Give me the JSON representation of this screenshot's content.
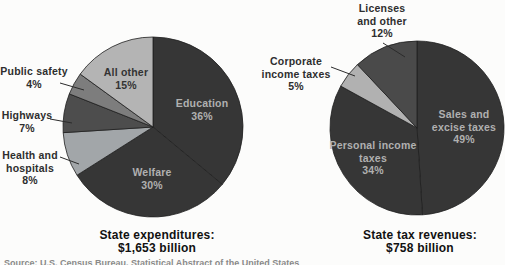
{
  "figure": {
    "background": "#fcfcfb",
    "dark_slice_color": "#363636",
    "inside_label_light_color": "#b0b0b0",
    "outside_label_color": "#2e2e2e",
    "source_note": "Source: U.S. Census Bureau, Statistical Abstract of the United States"
  },
  "chart_data": [
    {
      "type": "pie",
      "title": "State expenditures: $1,653 billion",
      "caption_line1": "State expenditures:",
      "caption_line2": "$1,653 billion",
      "total": "$1,653 billion",
      "start_angle_deg": 0,
      "direction": "clockwise",
      "legend_position": "labels-on-chart",
      "pie": {
        "cx": 153,
        "cy": 127,
        "r": 90
      },
      "slices": [
        {
          "name": "Education",
          "pct": 36,
          "pct_label": "36%",
          "color": "#363636",
          "label_lines": [
            "Education"
          ],
          "label_placement": "inside",
          "label_color": "#b0b0b0",
          "label_cx": 202,
          "label_cy": 109
        },
        {
          "name": "Welfare",
          "pct": 30,
          "pct_label": "30%",
          "color": "#363636",
          "label_lines": [
            "Welfare"
          ],
          "label_placement": "inside",
          "label_color": "#b0b0b0",
          "label_cx": 152,
          "label_cy": 178
        },
        {
          "name": "Health and hospitals",
          "pct": 8,
          "pct_label": "8%",
          "color": "#a2a6a9",
          "label_lines": [
            "Health and",
            "hospitals"
          ],
          "label_placement": "outside",
          "label_color": "#2e2e2e",
          "label_cx": 30,
          "label_cy": 168,
          "leader": [
            60,
            157,
            79,
            164
          ]
        },
        {
          "name": "Highways",
          "pct": 7,
          "pct_label": "7%",
          "color": "#4d4d4d",
          "label_lines": [
            "Highways"
          ],
          "label_placement": "outside",
          "label_color": "#2e2e2e",
          "label_cx": 27,
          "label_cy": 121,
          "leader": [
            50,
            119,
            72,
            123
          ]
        },
        {
          "name": "Public safety",
          "pct": 4,
          "pct_label": "4%",
          "color": "#7d7d7d",
          "label_lines": [
            "Public safety"
          ],
          "label_placement": "outside",
          "label_color": "#2e2e2e",
          "label_cx": 34,
          "label_cy": 77,
          "leader": [
            60,
            83,
            84,
            90
          ]
        },
        {
          "name": "All other",
          "pct": 15,
          "pct_label": "15%",
          "color": "#b4b4b4",
          "label_lines": [
            "All other"
          ],
          "label_placement": "inside",
          "label_color": "#333333",
          "label_cx": 126,
          "label_cy": 78
        }
      ]
    },
    {
      "type": "pie",
      "title": "State tax revenues: $758 billion",
      "caption_line1": "State tax revenues:",
      "caption_line2": "$758 billion",
      "total": "$758 billion",
      "start_angle_deg": 0,
      "direction": "clockwise",
      "legend_position": "labels-on-chart",
      "pie": {
        "cx": 164,
        "cy": 128,
        "r": 87
      },
      "slices": [
        {
          "name": "Sales and excise taxes",
          "pct": 49,
          "pct_label": "49%",
          "color": "#363636",
          "label_lines": [
            "Sales and",
            "excise taxes"
          ],
          "label_placement": "inside",
          "label_color": "#b0b0b0",
          "label_cx": 211,
          "label_cy": 127
        },
        {
          "name": "Personal income taxes",
          "pct": 34,
          "pct_label": "34%",
          "color": "#363636",
          "label_lines": [
            "Personal income",
            "taxes"
          ],
          "label_placement": "inside",
          "label_color": "#b0b0b0",
          "label_cx": 120,
          "label_cy": 158
        },
        {
          "name": "Corporate income taxes",
          "pct": 5,
          "pct_label": "5%",
          "color": "#b1b1b1",
          "label_lines": [
            "Corporate",
            "income taxes"
          ],
          "label_placement": "outside",
          "label_color": "#2e2e2e",
          "label_cx": 43,
          "label_cy": 74,
          "leader": [
            78,
            67,
            102,
            76
          ]
        },
        {
          "name": "Licenses and other",
          "pct": 12,
          "pct_label": "12%",
          "color": "#4a4a4a",
          "label_lines": [
            "Licenses",
            "and other"
          ],
          "label_placement": "outside",
          "label_color": "#2e2e2e",
          "label_cx": 129,
          "label_cy": 21,
          "leader": [
            130,
            43,
            152,
            57
          ]
        }
      ]
    }
  ]
}
